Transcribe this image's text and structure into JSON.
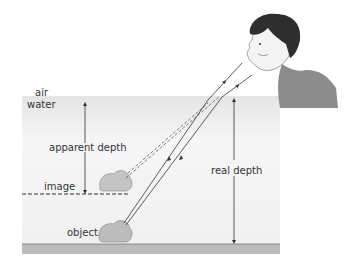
{
  "diagram": {
    "labels": {
      "air": "air",
      "water": "water",
      "apparent_depth": "apparent depth",
      "image": "image",
      "real_depth": "real depth",
      "object": "object"
    },
    "colors": {
      "water_top": "#e6e6e6",
      "water_bottom": "#fafafa",
      "tank_floor": "#b5b5b5",
      "rock": "#bdbdbd",
      "line": "#333333",
      "hoodie": "#8a8a8a",
      "hair": "#2b2b2b",
      "skin": "#f2f2f2"
    }
  }
}
